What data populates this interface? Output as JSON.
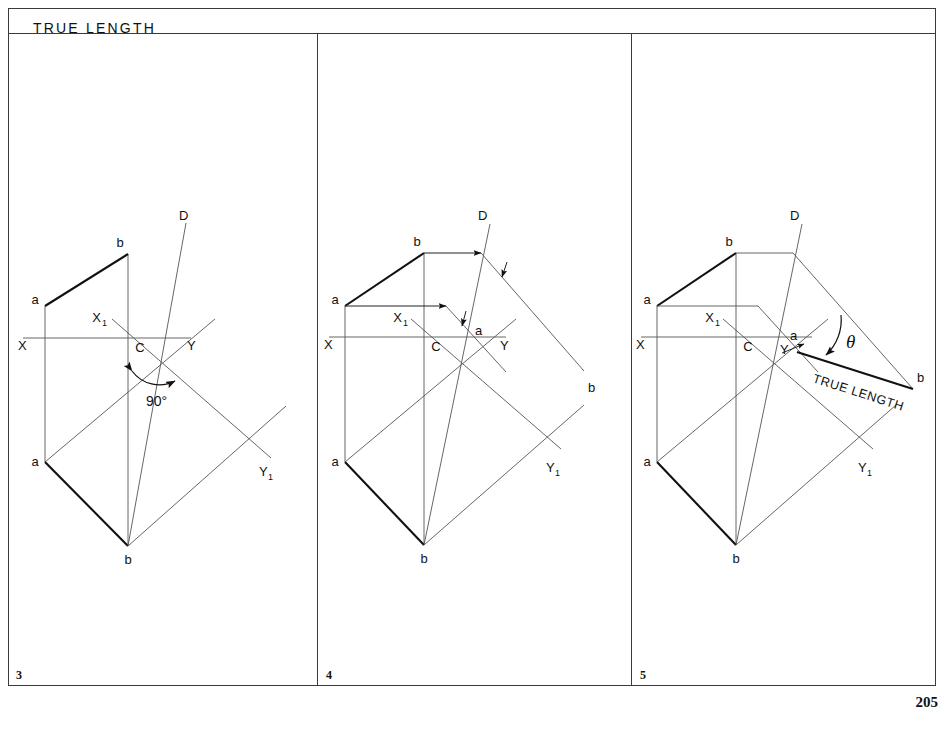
{
  "sheet": {
    "title": "TRUE LENGTH",
    "page_number": "205"
  },
  "panels": [
    {
      "number": "3",
      "labels": {
        "b_top": "b",
        "a_top": "a",
        "a_bottom": "a",
        "b_bottom": "b",
        "x_axis": "X",
        "y_axis": "Y",
        "center": "C",
        "x1": "X",
        "x1_sub": "1",
        "y1": "Y",
        "y1_sub": "1",
        "d_line": "D",
        "angle": "90°"
      }
    },
    {
      "number": "4",
      "labels": {
        "b_top": "b",
        "a_top": "a",
        "a_bottom": "a",
        "b_bottom": "b",
        "a_proj": "a",
        "b_proj": "b",
        "x_axis": "X",
        "y_axis": "Y",
        "center": "C",
        "x1": "X",
        "x1_sub": "1",
        "y1": "Y",
        "y1_sub": "1",
        "d_line": "D"
      }
    },
    {
      "number": "5",
      "labels": {
        "b_top": "b",
        "a_top": "a",
        "a_bottom": "a",
        "b_bottom": "b",
        "a_proj": "a",
        "b_proj": "b",
        "x_axis": "X",
        "y_axis": "Y",
        "y_pointer": "Y",
        "center": "C",
        "x1": "X",
        "x1_sub": "1",
        "y1": "Y",
        "y1_sub": "1",
        "d_line": "D",
        "theta": "θ",
        "true_length": "TRUE LENGTH"
      }
    }
  ],
  "colors": {
    "line_thin": "#555555",
    "line_thick": "#111111",
    "border": "#3a3a3a",
    "text": "#111111",
    "background": "#ffffff"
  }
}
